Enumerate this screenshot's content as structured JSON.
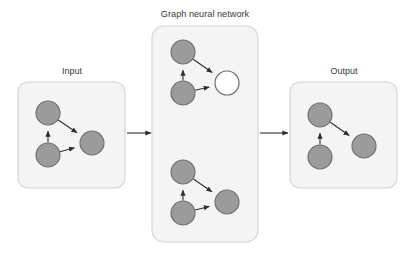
{
  "figure": {
    "type": "diagram",
    "subtype": "graph-neural-network-pipeline",
    "background_color": "#ffffff",
    "width": 410,
    "height": 256
  },
  "colors": {
    "panel_fill": "#f4f4f4",
    "panel_stroke": "#d2d2d2",
    "node_fill": "#9b9b9b",
    "node_highlight_fill": "#ffffff",
    "node_stroke": "#6e6e6e",
    "edge_stroke": "#2e2e2e",
    "label_text": "#3b3b3b"
  },
  "panels": [
    {
      "id": "input",
      "label": "Input",
      "label_x": 72,
      "label_y": 72,
      "rect": {
        "x": 18,
        "y": 82,
        "width": 107,
        "height": 106,
        "rx": 10
      }
    },
    {
      "id": "gnn",
      "label": "Graph neural network",
      "label_x": 205,
      "label_y": 15,
      "rect": {
        "x": 152,
        "y": 26,
        "width": 106,
        "height": 216,
        "rx": 12
      }
    },
    {
      "id": "output",
      "label": "Output",
      "label_x": 344,
      "label_y": 72,
      "rect": {
        "x": 290,
        "y": 82,
        "width": 107,
        "height": 106,
        "rx": 10
      }
    }
  ],
  "graphs": [
    {
      "id": "input-graph",
      "panel": "input",
      "nodes": [
        {
          "id": "a",
          "x": 48,
          "y": 113,
          "r": 12,
          "state": "normal"
        },
        {
          "id": "b",
          "x": 48,
          "y": 155,
          "r": 12,
          "state": "normal"
        },
        {
          "id": "c",
          "x": 92,
          "y": 143,
          "r": 12,
          "state": "normal"
        }
      ],
      "edges": [
        {
          "from": "b",
          "to": "a",
          "directed": true
        },
        {
          "from": "a",
          "to": "c",
          "directed": true
        },
        {
          "from": "b",
          "to": "c",
          "directed": true
        }
      ]
    },
    {
      "id": "gnn-graph-top",
      "panel": "gnn",
      "nodes": [
        {
          "id": "a",
          "x": 183,
          "y": 52,
          "r": 12,
          "state": "normal"
        },
        {
          "id": "b",
          "x": 183,
          "y": 93,
          "r": 12,
          "state": "normal"
        },
        {
          "id": "c",
          "x": 227,
          "y": 83,
          "r": 12,
          "state": "highlighted"
        }
      ],
      "edges": [
        {
          "from": "b",
          "to": "a",
          "directed": true
        },
        {
          "from": "a",
          "to": "c",
          "directed": true
        },
        {
          "from": "b",
          "to": "c",
          "directed": true
        }
      ]
    },
    {
      "id": "gnn-graph-bottom",
      "panel": "gnn",
      "nodes": [
        {
          "id": "a",
          "x": 183,
          "y": 172,
          "r": 12,
          "state": "normal"
        },
        {
          "id": "b",
          "x": 183,
          "y": 213,
          "r": 12,
          "state": "normal"
        },
        {
          "id": "c",
          "x": 227,
          "y": 202,
          "r": 12,
          "state": "normal"
        }
      ],
      "edges": [
        {
          "from": "b",
          "to": "a",
          "directed": true
        },
        {
          "from": "a",
          "to": "c",
          "directed": true
        },
        {
          "from": "b",
          "to": "c",
          "directed": true
        }
      ]
    },
    {
      "id": "output-graph",
      "panel": "output",
      "nodes": [
        {
          "id": "a",
          "x": 320,
          "y": 115,
          "r": 12,
          "state": "normal"
        },
        {
          "id": "b",
          "x": 320,
          "y": 157,
          "r": 12,
          "state": "normal"
        },
        {
          "id": "c",
          "x": 364,
          "y": 146,
          "r": 12,
          "state": "normal"
        }
      ],
      "edges": [
        {
          "from": "b",
          "to": "a",
          "directed": true
        },
        {
          "from": "a",
          "to": "c",
          "directed": true
        }
      ]
    }
  ],
  "connectors": [
    {
      "id": "input-to-gnn",
      "from_x": 127,
      "from_y": 133,
      "to_x": 151,
      "to_y": 133,
      "directed": true
    },
    {
      "id": "gnn-to-output",
      "from_x": 260,
      "from_y": 133,
      "to_x": 288,
      "to_y": 133,
      "directed": true
    }
  ]
}
